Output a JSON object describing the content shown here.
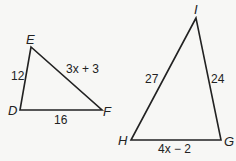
{
  "figure": {
    "triangle_def": {
      "vertices": {
        "E": "E",
        "D": "D",
        "F": "F"
      },
      "sides": {
        "DE": "12",
        "EF": "3x + 3",
        "DF": "16"
      }
    },
    "triangle_ghi": {
      "vertices": {
        "I": "I",
        "H": "H",
        "G": "G"
      },
      "sides": {
        "HI": "27",
        "GI": "24",
        "HG": "4x − 2"
      }
    },
    "stroke_color": "#222222",
    "background_color": "#f7f7f5"
  }
}
